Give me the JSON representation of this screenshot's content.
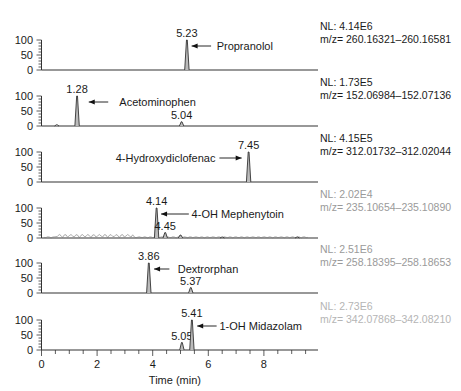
{
  "chart_data": {
    "type": "line",
    "title": "",
    "xlabel": "Time (min)",
    "ylabel": "",
    "xlim": [
      0,
      9.8
    ],
    "ylim": [
      0,
      100
    ],
    "x_ticks": [
      0,
      2,
      4,
      6,
      8
    ],
    "y_ticks": [
      0,
      50,
      100
    ],
    "grid": false,
    "panels": [
      {
        "compound": "Propranolol",
        "NL": "NL: 4.14E6",
        "mz": "m/z= 260.16321–260.16581",
        "info_color": "#1a1a1a",
        "peaks": [
          {
            "rt": 5.23,
            "height": 100,
            "label": "5.23"
          }
        ],
        "arrow": {
          "from_x": 6.1,
          "to_x": 5.4,
          "y": 80
        },
        "label_pos": {
          "x": 6.3,
          "y": 80
        }
      },
      {
        "compound": "Acetominophen",
        "NL": "NL: 1.73E5",
        "mz": "m/z= 152.06984–152.07136",
        "info_color": "#1a1a1a",
        "peaks": [
          {
            "rt": 0.55,
            "height": 4,
            "label": ""
          },
          {
            "rt": 1.28,
            "height": 100,
            "label": "1.28"
          },
          {
            "rt": 5.04,
            "height": 14,
            "label": "5.04"
          }
        ],
        "arrow": {
          "from_x": 2.4,
          "to_x": 1.7,
          "y": 80
        },
        "label_pos": {
          "x": 2.8,
          "y": 80
        }
      },
      {
        "compound": "4-Hydroxydiclofenac",
        "NL": "NL: 4.15E5",
        "mz": "m/z= 312.01732–312.02044",
        "info_color": "#1a1a1a",
        "peaks": [
          {
            "rt": 7.45,
            "height": 100,
            "label": "7.45"
          }
        ],
        "arrow": {
          "from_x": 6.4,
          "to_x": 7.2,
          "y": 80
        },
        "label_pos": {
          "x": 3.2,
          "y": 80
        }
      },
      {
        "compound": "4-OH Mephenytoin",
        "NL": "NL: 2.02E4",
        "mz": "m/z= 235.10654–235.10890",
        "info_color": "#9a9a9a",
        "peaks": [
          {
            "rt": 4.14,
            "height": 100,
            "label": "4.14"
          },
          {
            "rt": 4.45,
            "height": 18,
            "label": "4.45"
          },
          {
            "rt": 5.0,
            "height": 10,
            "label": ""
          },
          {
            "rt": 6.5,
            "height": 3,
            "label": ""
          },
          {
            "rt": 9.2,
            "height": 3,
            "label": ""
          }
        ],
        "noise": true,
        "arrow": {
          "from_x": 5.3,
          "to_x": 4.3,
          "y": 80
        },
        "label_pos": {
          "x": 5.4,
          "y": 80
        }
      },
      {
        "compound": "Dextrorphan",
        "NL": "NL: 2.51E6",
        "mz": "m/z= 258.18395–258.18653",
        "info_color": "#9a9a9a",
        "peaks": [
          {
            "rt": 3.86,
            "height": 100,
            "label": "3.86"
          },
          {
            "rt": 5.37,
            "height": 18,
            "label": "5.37"
          }
        ],
        "arrow": {
          "from_x": 4.6,
          "to_x": 4.05,
          "y": 80
        },
        "label_pos": {
          "x": 4.9,
          "y": 80
        }
      },
      {
        "compound": "1-OH Midazolam",
        "NL": "NL: 2.73E6",
        "mz": "m/z= 342.07868–342.08210",
        "info_color": "#b5b5b5",
        "peaks": [
          {
            "rt": 5.05,
            "height": 25,
            "label": "5.05"
          },
          {
            "rt": 5.41,
            "height": 100,
            "label": "5.41"
          }
        ],
        "arrow": {
          "from_x": 6.3,
          "to_x": 5.6,
          "y": 80
        },
        "label_pos": {
          "x": 6.4,
          "y": 80
        }
      }
    ]
  },
  "axis": {
    "x_label": "Time (min)",
    "x_tick_labels": [
      "0",
      "2",
      "4",
      "6",
      "8"
    ],
    "y_tick_labels": [
      "0",
      "50",
      "100"
    ]
  }
}
